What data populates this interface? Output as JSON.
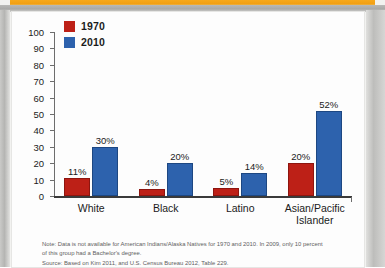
{
  "figure": {
    "legend": [
      {
        "label": "1970",
        "color": "#bd2017"
      },
      {
        "label": "2010",
        "color": "#2d62ad"
      }
    ],
    "note_line1": "Note: Data is not available for American Indians/Alaska Natives for 1970 and 2010. In 2009, only 10 percent",
    "note_line2": "of this group had a Bachelor's degree.",
    "note_line3": "Source: Based on Kim 2011, and U.S. Census Bureau 2012, Table 229."
  },
  "chart_data": {
    "type": "bar",
    "title": "",
    "xlabel": "",
    "ylabel": "",
    "ylim": [
      0,
      100
    ],
    "yticks": [
      0,
      10,
      20,
      30,
      40,
      50,
      60,
      70,
      80,
      90,
      100
    ],
    "ytick_labels": [
      "0",
      "10",
      "20",
      "30",
      "40",
      "50",
      "60",
      "70",
      "80",
      "90",
      "100"
    ],
    "grid": false,
    "legend_position": "top-left",
    "categories": [
      "White",
      "Black",
      "Latino",
      "Asian/Pacific\nIslander"
    ],
    "series": [
      {
        "name": "1970",
        "color": "#bd2017",
        "values": [
          11,
          4,
          5,
          20
        ],
        "labels": [
          "11%",
          "4%",
          "5%",
          "20%"
        ]
      },
      {
        "name": "2010",
        "color": "#2d62ad",
        "values": [
          30,
          20,
          14,
          52
        ],
        "labels": [
          "30%",
          "20%",
          "14%",
          "52%"
        ]
      }
    ]
  }
}
